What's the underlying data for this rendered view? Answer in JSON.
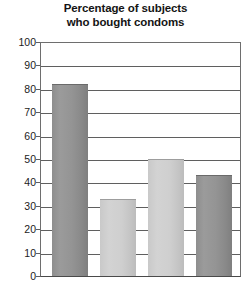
{
  "chart_data": {
    "type": "bar",
    "title": "Percentage of subjects who bought condoms",
    "title_lines": [
      "Percentage of subjects",
      "who bought condoms"
    ],
    "xlabel": "",
    "ylabel": "",
    "ylim": [
      0,
      100
    ],
    "y_ticks": [
      100,
      90,
      80,
      70,
      60,
      50,
      40,
      30,
      20,
      10,
      0
    ],
    "y_tick_labels": [
      "100",
      "90",
      "80",
      "70",
      "60",
      "50",
      "40",
      "30",
      "20",
      "10",
      "0"
    ],
    "grid": true,
    "legend": "none",
    "categories": [
      "1",
      "2",
      "3",
      "4"
    ],
    "x_tick_labels": [
      "",
      "",
      "",
      ""
    ],
    "values": [
      82,
      33,
      50,
      43
    ],
    "bars": [
      {
        "label": "",
        "value": 82,
        "color": "#949494",
        "shade": "dark"
      },
      {
        "label": "",
        "value": 33,
        "color": "#cfcfcf",
        "shade": "light"
      },
      {
        "label": "",
        "value": 50,
        "color": "#cfcfcf",
        "shade": "light"
      },
      {
        "label": "",
        "value": 43,
        "color": "#949494",
        "shade": "dark"
      }
    ]
  },
  "colors": {
    "axis": "#5f5f5f",
    "gridline": "#5f5f5f",
    "text": "#1c1c1c",
    "title": "#141414",
    "bar_dark": "#949494",
    "bar_light": "#cfcfcf",
    "background": "#ffffff"
  }
}
